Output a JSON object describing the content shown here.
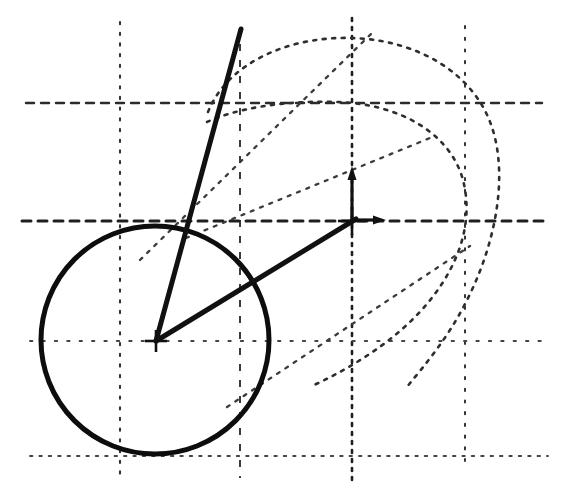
{
  "figure": {
    "canvas": {
      "width": 565,
      "height": 494
    },
    "background_color": "#ffffff",
    "ink_color": "#1a1a1a",
    "grid_color": "#3a3a3a"
  },
  "chart_data": {
    "type": "scatter",
    "title": "",
    "xlabel": "",
    "ylabel": "",
    "grid": true,
    "legend": null,
    "xlim": [
      0,
      565
    ],
    "ylim": [
      0,
      494
    ],
    "grid_lines": {
      "vertical_x": [
        120,
        240,
        352,
        465
      ],
      "horizontal_y": [
        103,
        221,
        341,
        456
      ],
      "styles": {
        "vertical_120": "dotted",
        "vertical_240": "dashed",
        "vertical_352": "dotted-bold",
        "vertical_465": "dotted",
        "horizontal_103": "dashed",
        "horizontal_221": "dashed-bold",
        "horizontal_341": "dotted-fine",
        "horizontal_456": "dotted-fine"
      }
    },
    "solid_circle": {
      "label": "primary-circle",
      "center_x": 155,
      "center_y": 340,
      "radius": 114,
      "stroke_width": 5,
      "style": "solid-bold"
    },
    "outer_arc": {
      "label": "outer-dotted-arc",
      "center_x": 352,
      "center_y": 228,
      "radius_x": 150,
      "radius_y": 190,
      "style": "dotted",
      "start_angle_deg": 160,
      "end_angle_deg": 380
    },
    "inner_arc": {
      "label": "inner-dotted-arc",
      "center_x": 340,
      "center_y": 228,
      "radius_x": 128,
      "radius_y": 128,
      "style": "dotted",
      "start_angle_deg": 168,
      "end_angle_deg": 395
    },
    "origin_marker": {
      "label": "origin-crosshair",
      "x": 352,
      "y": 221,
      "arm_length": 14
    },
    "origin_axis_arrows": [
      {
        "name": "up-arrow",
        "from_x": 352,
        "from_y": 221,
        "to_x": 352,
        "to_y": 168
      },
      {
        "name": "right-arrow",
        "from_x": 352,
        "from_y": 221,
        "to_x": 385,
        "to_y": 220
      }
    ],
    "center_marker": {
      "label": "circle-center-crosshair",
      "x": 156,
      "y": 341,
      "arm_length": 11
    },
    "bold_rays": [
      {
        "name": "steep-ray",
        "from_x": 156,
        "from_y": 341,
        "to_x": 241,
        "to_y": 29,
        "stroke_width": 5
      },
      {
        "name": "radius-ray-to-origin",
        "from_x": 156,
        "from_y": 341,
        "to_x": 356,
        "to_y": 219,
        "stroke_width": 5
      }
    ],
    "faint_rays": [
      {
        "name": "upper-tangent-line",
        "from_x": 140,
        "from_y": 260,
        "to_x": 372,
        "to_y": 33,
        "style": "dotted"
      },
      {
        "name": "mid-chord-line",
        "from_x": 186,
        "from_y": 238,
        "to_x": 430,
        "to_y": 138,
        "style": "dotted"
      },
      {
        "name": "lower-diagonal-line",
        "from_x": 227,
        "from_y": 407,
        "to_x": 470,
        "to_y": 246,
        "style": "dotted"
      }
    ]
  },
  "annotations": []
}
